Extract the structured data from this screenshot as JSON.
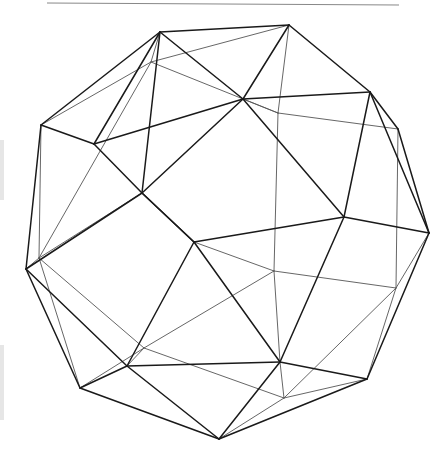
{
  "figure": {
    "title": "",
    "colors": {
      "background": "#ffffff",
      "front_edge": "#1a1a1a",
      "back_edge": "#555555",
      "rule": "#888888",
      "scan_mark": "#e6e6e6"
    },
    "rule": {
      "x1": 47,
      "y1": 3,
      "x2": 399,
      "y2": 5
    },
    "front_vertices": {
      "A": [
        160,
        32
      ],
      "B": [
        289,
        25
      ],
      "C": [
        243,
        99
      ],
      "D": [
        41,
        125
      ],
      "E": [
        94,
        144
      ],
      "F": [
        142,
        193
      ],
      "G": [
        370,
        92
      ],
      "H": [
        398,
        129
      ],
      "I": [
        344,
        217
      ],
      "J": [
        429,
        233
      ],
      "K": [
        194,
        242
      ],
      "L": [
        26,
        269
      ],
      "M": [
        80,
        388
      ],
      "N": [
        127,
        366
      ],
      "O": [
        280,
        362
      ],
      "P": [
        367,
        379
      ],
      "Q": [
        219,
        439
      ]
    },
    "back_vertices": {
      "a": [
        151,
        62
      ],
      "b": [
        278,
        113
      ],
      "c": [
        39,
        258
      ],
      "d": [
        274,
        271
      ],
      "e": [
        144,
        348
      ],
      "f": [
        396,
        288
      ],
      "g": [
        284,
        398
      ]
    },
    "front_edges": [
      [
        "A",
        "B"
      ],
      [
        "A",
        "D"
      ],
      [
        "A",
        "C"
      ],
      [
        "A",
        "E"
      ],
      [
        "A",
        "F"
      ],
      [
        "B",
        "G"
      ],
      [
        "B",
        "C"
      ],
      [
        "G",
        "C"
      ],
      [
        "G",
        "H"
      ],
      [
        "G",
        "I"
      ],
      [
        "H",
        "J"
      ],
      [
        "G",
        "J"
      ],
      [
        "C",
        "E"
      ],
      [
        "E",
        "D"
      ],
      [
        "E",
        "F"
      ],
      [
        "D",
        "L"
      ],
      [
        "F",
        "L"
      ],
      [
        "F",
        "C"
      ],
      [
        "C",
        "I"
      ],
      [
        "I",
        "J"
      ],
      [
        "I",
        "K"
      ],
      [
        "K",
        "F"
      ],
      [
        "F",
        "K"
      ],
      [
        "K",
        "N"
      ],
      [
        "K",
        "O"
      ],
      [
        "I",
        "O"
      ],
      [
        "J",
        "P"
      ],
      [
        "L",
        "M"
      ],
      [
        "L",
        "N"
      ],
      [
        "M",
        "N"
      ],
      [
        "N",
        "O"
      ],
      [
        "M",
        "Q"
      ],
      [
        "N",
        "Q"
      ],
      [
        "O",
        "Q"
      ],
      [
        "O",
        "P"
      ],
      [
        "P",
        "Q"
      ]
    ],
    "back_edges": [
      [
        "a",
        "B"
      ],
      [
        "a",
        "A"
      ],
      [
        "a",
        "D"
      ],
      [
        "a",
        "c"
      ],
      [
        "a",
        "b"
      ],
      [
        "b",
        "B"
      ],
      [
        "b",
        "H"
      ],
      [
        "b",
        "d"
      ],
      [
        "b",
        "C"
      ],
      [
        "c",
        "D"
      ],
      [
        "c",
        "L"
      ],
      [
        "c",
        "F"
      ],
      [
        "c",
        "e"
      ],
      [
        "c",
        "M"
      ],
      [
        "d",
        "K"
      ],
      [
        "d",
        "e"
      ],
      [
        "d",
        "f"
      ],
      [
        "d",
        "O"
      ],
      [
        "e",
        "M"
      ],
      [
        "e",
        "g"
      ],
      [
        "e",
        "N"
      ],
      [
        "f",
        "J"
      ],
      [
        "f",
        "H"
      ],
      [
        "f",
        "g"
      ],
      [
        "f",
        "P"
      ],
      [
        "g",
        "O"
      ],
      [
        "g",
        "P"
      ],
      [
        "g",
        "Q"
      ]
    ]
  }
}
